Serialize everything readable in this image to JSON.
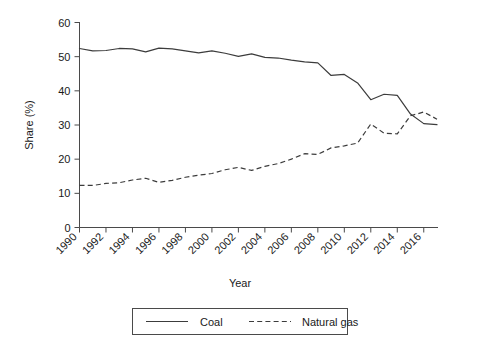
{
  "chart_data": {
    "type": "line",
    "title": "",
    "xlabel": "Year",
    "ylabel": "Share (%)",
    "xlim": [
      1990,
      2017
    ],
    "ylim": [
      0,
      60
    ],
    "grid": false,
    "legend_position": "bottom",
    "x": [
      1990,
      1991,
      1992,
      1993,
      1994,
      1995,
      1996,
      1997,
      1998,
      1999,
      2000,
      2001,
      2002,
      2003,
      2004,
      2005,
      2006,
      2007,
      2008,
      2009,
      2010,
      2011,
      2012,
      2013,
      2014,
      2015,
      2016,
      2017
    ],
    "xticks": [
      "1990",
      "1992",
      "1994",
      "1996",
      "1998",
      "2000",
      "2002",
      "2004",
      "2006",
      "2008",
      "2010",
      "2012",
      "2014",
      "2016"
    ],
    "yticks": [
      "0",
      "10",
      "20",
      "30",
      "40",
      "50",
      "60"
    ],
    "series": [
      {
        "name": "Coal",
        "style": "solid",
        "color": "#3c3c3c",
        "values": [
          52.4,
          51.7,
          51.8,
          52.4,
          52.3,
          51.4,
          52.5,
          52.3,
          51.7,
          51.1,
          51.7,
          51.0,
          50.1,
          50.8,
          49.8,
          49.6,
          49.0,
          48.5,
          48.2,
          44.5,
          44.8,
          42.3,
          37.4,
          39.0,
          38.7,
          33.2,
          30.4,
          30.1
        ]
      },
      {
        "name": "Natural gas",
        "style": "dashed",
        "color": "#3c3c3c",
        "values": [
          12.3,
          12.3,
          12.9,
          13.1,
          13.9,
          14.4,
          13.2,
          13.8,
          14.7,
          15.3,
          15.8,
          16.9,
          17.6,
          16.7,
          17.9,
          18.7,
          20.0,
          21.6,
          21.4,
          23.3,
          23.9,
          24.7,
          30.3,
          27.6,
          27.4,
          32.7,
          33.8,
          31.7
        ]
      }
    ],
    "legend": [
      {
        "label": "Coal",
        "style": "solid"
      },
      {
        "label": "Natural gas",
        "style": "dashed"
      }
    ]
  }
}
